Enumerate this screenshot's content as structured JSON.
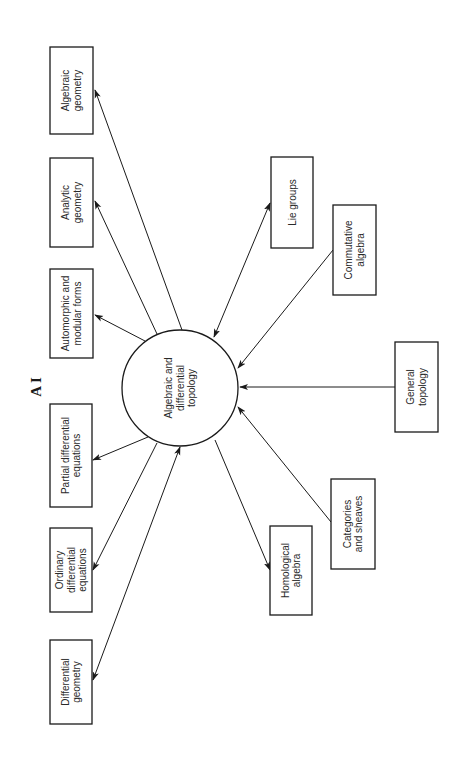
{
  "figure": {
    "title": "A I",
    "center_node": {
      "id": "hub",
      "label_lines": [
        "Algebraic and",
        "differential",
        "topology"
      ],
      "cx": 180,
      "cy": 388,
      "r": 58
    },
    "nodes": [
      {
        "id": "algebraic-geometry",
        "label_lines": [
          "Algebraic",
          "geometry"
        ],
        "x": 50,
        "y": 47,
        "w": 43,
        "h": 87
      },
      {
        "id": "analytic-geometry",
        "label_lines": [
          "Analytic",
          "geometry"
        ],
        "x": 50,
        "y": 158,
        "w": 43,
        "h": 89
      },
      {
        "id": "automorphic-modular-forms",
        "label_lines": [
          "Automorphic and",
          "modular forms"
        ],
        "x": 50,
        "y": 269,
        "w": 43,
        "h": 89
      },
      {
        "id": "partial-differential-equations",
        "label_lines": [
          "Partial differential",
          "equations"
        ],
        "x": 50,
        "y": 404,
        "w": 42,
        "h": 103
      },
      {
        "id": "ordinary-differential-equations",
        "label_lines": [
          "Ordinary",
          "differential",
          "equations"
        ],
        "x": 50,
        "y": 528,
        "w": 42,
        "h": 84
      },
      {
        "id": "differential-geometry",
        "label_lines": [
          "Differential",
          "geometry"
        ],
        "x": 50,
        "y": 640,
        "w": 42,
        "h": 84
      },
      {
        "id": "lie-groups",
        "label_lines": [
          "Lie groups"
        ],
        "x": 271,
        "y": 157,
        "w": 42,
        "h": 91
      },
      {
        "id": "commutative-algebra",
        "label_lines": [
          "Commutative",
          "algebra"
        ],
        "x": 333,
        "y": 205,
        "w": 43,
        "h": 90
      },
      {
        "id": "general-topology",
        "label_lines": [
          "General",
          "topology"
        ],
        "x": 395,
        "y": 342,
        "w": 43,
        "h": 90
      },
      {
        "id": "categories-and-sheaves",
        "label_lines": [
          "Categories",
          "and sheaves"
        ],
        "x": 331,
        "y": 479,
        "w": 44,
        "h": 90
      },
      {
        "id": "homological-algebra",
        "label_lines": [
          "Homological",
          "algebra"
        ],
        "x": 270,
        "y": 526,
        "w": 42,
        "h": 89
      }
    ],
    "edges": [
      {
        "to": "algebraic-geometry",
        "x1": 182,
        "y1": 330,
        "x2": 95,
        "y2": 90,
        "start_arrow": false,
        "end_arrow": true
      },
      {
        "to": "analytic-geometry",
        "x1": 157,
        "y1": 334,
        "x2": 95,
        "y2": 201,
        "start_arrow": false,
        "end_arrow": true
      },
      {
        "to": "automorphic-modular-forms",
        "x1": 145,
        "y1": 341,
        "x2": 95,
        "y2": 315,
        "start_arrow": false,
        "end_arrow": true
      },
      {
        "to": "partial-differential-equations",
        "x1": 148,
        "y1": 437,
        "x2": 93,
        "y2": 460,
        "start_arrow": false,
        "end_arrow": true
      },
      {
        "to": "ordinary-differential-equations",
        "x1": 157,
        "y1": 443,
        "x2": 93,
        "y2": 570,
        "start_arrow": false,
        "end_arrow": true
      },
      {
        "to": "differential-geometry",
        "x1": 180,
        "y1": 447,
        "x2": 93,
        "y2": 680,
        "start_arrow": true,
        "end_arrow": true
      },
      {
        "to": "lie-groups",
        "x1": 214,
        "y1": 337,
        "x2": 270,
        "y2": 203,
        "start_arrow": true,
        "end_arrow": true
      },
      {
        "from": "commutative-algebra",
        "x1": 333,
        "y1": 250,
        "x2": 238,
        "y2": 368,
        "start_arrow": false,
        "end_arrow": true
      },
      {
        "from": "general-topology",
        "x1": 395,
        "y1": 387,
        "x2": 240,
        "y2": 387,
        "start_arrow": false,
        "end_arrow": true
      },
      {
        "from": "categories-and-sheaves",
        "x1": 331,
        "y1": 522,
        "x2": 238,
        "y2": 407,
        "start_arrow": false,
        "end_arrow": true
      },
      {
        "to": "homological-algebra",
        "x1": 215,
        "y1": 440,
        "x2": 270,
        "y2": 570,
        "start_arrow": false,
        "end_arrow": true
      }
    ]
  }
}
